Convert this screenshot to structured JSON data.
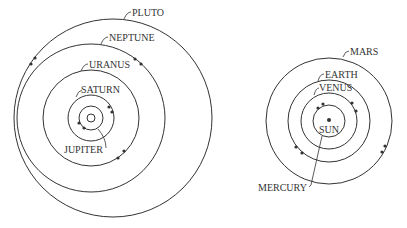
{
  "diagram": {
    "outer_system": {
      "planets": [
        {
          "label": "JUPITER"
        },
        {
          "label": "SATURN"
        },
        {
          "label": "URANUS"
        },
        {
          "label": "NEPTUNE"
        },
        {
          "label": "PLUTO"
        }
      ]
    },
    "inner_system": {
      "sun_label": "SUN",
      "planets": [
        {
          "label": "MERCURY"
        },
        {
          "label": "VENUS"
        },
        {
          "label": "EARTH"
        },
        {
          "label": "MARS"
        }
      ]
    }
  }
}
